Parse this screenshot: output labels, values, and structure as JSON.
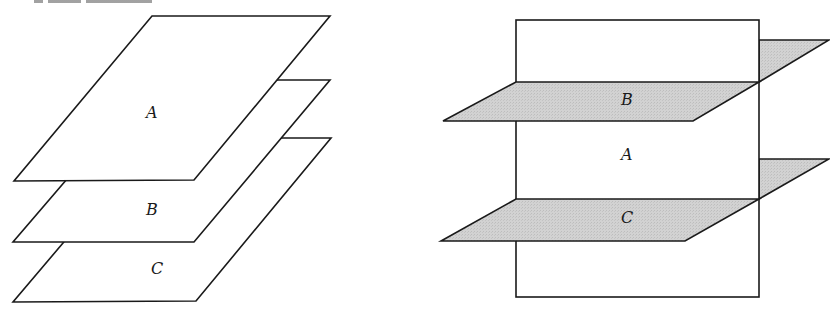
{
  "figure": {
    "header_fragment": "(cropped text at top edge)",
    "colors": {
      "line": "#1a1a1a",
      "plane_fill_white": "#ffffff",
      "plane_fill_shaded": "#cfcfcf"
    },
    "left_diagram": {
      "description": "Three parallel planes stacked vertically",
      "planes": [
        {
          "label": "A",
          "fill": "white"
        },
        {
          "label": "B",
          "fill": "white"
        },
        {
          "label": "C",
          "fill": "white"
        }
      ]
    },
    "right_diagram": {
      "description": "Vertical plane A intersected by two horizontal shaded planes B and C",
      "planes": [
        {
          "label": "B",
          "fill": "shaded",
          "orientation": "horizontal"
        },
        {
          "label": "A",
          "fill": "white",
          "orientation": "vertical"
        },
        {
          "label": "C",
          "fill": "shaded",
          "orientation": "horizontal"
        }
      ]
    }
  }
}
